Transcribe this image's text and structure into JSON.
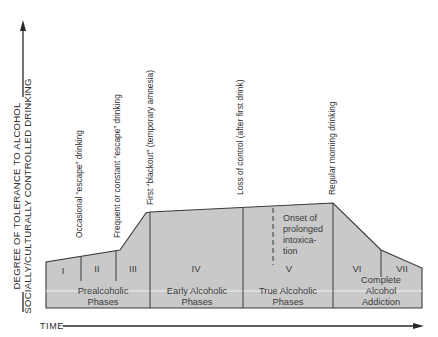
{
  "y_axis": {
    "line1": "DEGREE OF TOLERANCE TO ALCOHOL",
    "line2": "SOCIALLY/CULTURALLY CONTROLLED DRINKING"
  },
  "x_axis": {
    "label": "TIME"
  },
  "annotations": [
    {
      "id": "occasional",
      "text": "Occasional “escape” drinking"
    },
    {
      "id": "frequent",
      "text": "Frequent or constant “escape” drinking"
    },
    {
      "id": "blackout",
      "text": "First “blackout” (temporary amnesia)"
    },
    {
      "id": "loss",
      "text": "Loss of control (after first drink)"
    },
    {
      "id": "morning",
      "text": "Regular morning drinking"
    }
  ],
  "stages": [
    "I",
    "II",
    "III",
    "IV",
    "V",
    "VI",
    "VII"
  ],
  "onset": {
    "lines": [
      "Onset of",
      "prolonged",
      "intoxica-",
      "tion"
    ]
  },
  "phase_groups": [
    {
      "line1": "Prealcoholic",
      "line2": "Phases"
    },
    {
      "line1": "Early Alcoholic",
      "line2": "Phases"
    },
    {
      "line1": "True Alcoholic",
      "line2": "Phases"
    },
    {
      "line1": "Complete",
      "line2": "Alcohol",
      "line3": "Addiction"
    }
  ],
  "colors": {
    "fill": "#c9c9c9",
    "stroke": "#3a3a3a",
    "divider_band": "#f2f2f2"
  }
}
